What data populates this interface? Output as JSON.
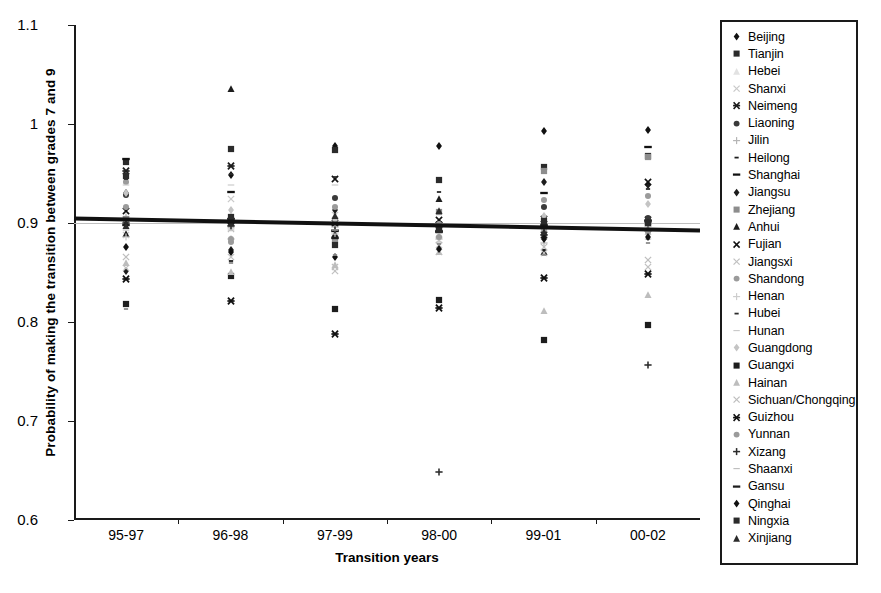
{
  "chart_data": {
    "type": "scatter",
    "title": "",
    "xlabel": "Transition years",
    "ylabel": "Probability of making the transition between grades 7 and 9",
    "categories": [
      "95-97",
      "96-98",
      "97-99",
      "98-00",
      "99-01",
      "00-02"
    ],
    "ylim": [
      0.6,
      1.1
    ],
    "yticks": [
      "0.6",
      "0.7",
      "0.8",
      "0.9",
      "1",
      "1.1"
    ],
    "ytick_values": [
      0.6,
      0.7,
      0.8,
      0.9,
      1.0,
      1.1
    ],
    "grid": "horizontal gridline at 0.9 only",
    "legend_position": "right, boxed",
    "trendline": {
      "name": "linear fit",
      "color": "#111111",
      "width_px": 4,
      "y_start": 0.9045,
      "y_end": 0.8925
    },
    "series": [
      {
        "name": "Beijing",
        "marker": "diamond-filled",
        "color": "#111111",
        "values": [
          0.93,
          0.948,
          0.978,
          0.978,
          0.993,
          0.994
        ]
      },
      {
        "name": "Tianjin",
        "marker": "square-filled",
        "color": "#2b2b2b",
        "values": [
          0.962,
          0.975,
          0.974,
          0.943,
          0.957,
          0.968
        ]
      },
      {
        "name": "Hebei",
        "marker": "triangle-light",
        "color": "#e2e2e2",
        "values": [
          0.902,
          0.908,
          0.899,
          0.901,
          0.9,
          0.899
        ]
      },
      {
        "name": "Shanxi",
        "marker": "x-light",
        "color": "#c9c9c9",
        "values": [
          0.888,
          0.924,
          0.908,
          0.883,
          0.889,
          0.891
        ]
      },
      {
        "name": "Neimeng",
        "marker": "star-x-bold",
        "color": "#1d1d1d",
        "values": [
          0.953,
          0.958,
          0.9,
          0.898,
          0.888,
          0.903
        ]
      },
      {
        "name": "Liaoning",
        "marker": "circle-filled",
        "color": "#3a3a3a",
        "values": [
          0.928,
          0.906,
          0.925,
          0.898,
          0.916,
          0.905
        ]
      },
      {
        "name": "Jilin",
        "marker": "plus-light",
        "color": "#b5b5b5",
        "values": [
          0.906,
          0.884,
          0.896,
          0.884,
          0.88,
          0.897
        ]
      },
      {
        "name": "Heilong",
        "marker": "dash-small",
        "color": "#1d1d1d",
        "values": [
          0.9,
          0.862,
          0.876,
          0.886,
          0.873,
          0.884
        ]
      },
      {
        "name": "Shanghai",
        "marker": "dash-bold",
        "color": "#111111",
        "values": [
          0.965,
          0.931,
          0.892,
          0.891,
          0.93,
          0.977
        ]
      },
      {
        "name": "Jiangsu",
        "marker": "diamond-filled",
        "color": "#1d1d1d",
        "values": [
          0.852,
          0.873,
          0.913,
          0.898,
          0.941,
          0.938
        ]
      },
      {
        "name": "Zhejiang",
        "marker": "square-grey",
        "color": "#8d8d8d",
        "values": [
          0.904,
          0.898,
          0.884,
          0.911,
          0.953,
          0.967
        ]
      },
      {
        "name": "Anhui",
        "marker": "triangle-dark",
        "color": "#1d1d1d",
        "values": [
          0.889,
          1.035,
          0.889,
          0.924,
          0.871,
          0.894
        ]
      },
      {
        "name": "Fujian",
        "marker": "x-bold",
        "color": "#111111",
        "values": [
          0.912,
          0.902,
          0.944,
          0.903,
          0.904,
          0.941
        ]
      },
      {
        "name": "Jiangsxi",
        "marker": "x-light",
        "color": "#c0c0c0",
        "values": [
          0.855,
          0.866,
          0.852,
          0.871,
          0.87,
          0.856
        ]
      },
      {
        "name": "Shandong",
        "marker": "circle-grey",
        "color": "#9b9b9b",
        "values": [
          0.941,
          0.881,
          0.916,
          0.899,
          0.923,
          0.927
        ]
      },
      {
        "name": "Henan",
        "marker": "plus-light",
        "color": "#cdcdcd",
        "values": [
          0.886,
          0.895,
          0.889,
          0.886,
          0.895,
          0.893
        ]
      },
      {
        "name": "Hubei",
        "marker": "dash-small",
        "color": "#2b2b2b",
        "values": [
          0.944,
          0.949,
          0.946,
          0.931,
          0.902,
          0.934
        ]
      },
      {
        "name": "Hunan",
        "marker": "dash-light",
        "color": "#c9c9c9",
        "values": [
          0.938,
          0.938,
          0.938,
          0.88,
          0.884,
          0.884
        ]
      },
      {
        "name": "Guangdong",
        "marker": "diamond-light",
        "color": "#c4c4c4",
        "values": [
          0.93,
          0.913,
          0.903,
          0.892,
          0.907,
          0.919
        ]
      },
      {
        "name": "Guangxi",
        "marker": "square-filled",
        "color": "#1d1d1d",
        "values": [
          0.818,
          0.846,
          0.813,
          0.822,
          0.782,
          0.797
        ]
      },
      {
        "name": "Hainan",
        "marker": "triangle-light",
        "color": "#bdbdbd",
        "values": [
          0.86,
          0.851,
          0.858,
          0.871,
          0.811,
          0.827
        ]
      },
      {
        "name": "Sichuan/Chongqing",
        "marker": "x-light",
        "color": "#bdbdbd",
        "values": [
          0.866,
          0.894,
          0.856,
          0.878,
          0.876,
          0.863
        ]
      },
      {
        "name": "Guizhou",
        "marker": "star-x-bold",
        "color": "#111111",
        "values": [
          0.843,
          0.821,
          0.788,
          0.814,
          0.844,
          0.848
        ]
      },
      {
        "name": "Yunnan",
        "marker": "circle-grey",
        "color": "#9b9b9b",
        "values": [
          0.916,
          0.884,
          0.881,
          0.886,
          0.893,
          0.891
        ]
      },
      {
        "name": "Xizang",
        "marker": "plus-bold",
        "color": "#2b2b2b",
        "values": [
          0.9,
          0.897,
          0.893,
          0.648,
          0.897,
          0.757
        ]
      },
      {
        "name": "Shaanxi",
        "marker": "dash-light",
        "color": "#bdbdbd",
        "values": [
          0.893,
          0.893,
          0.893,
          0.893,
          0.893,
          0.893
        ]
      },
      {
        "name": "Gansu",
        "marker": "dash-bold",
        "color": "#1d1d1d",
        "values": [
          0.898,
          0.904,
          0.885,
          0.892,
          0.898,
          0.902
        ]
      },
      {
        "name": "Qinghai",
        "marker": "diamond-filled",
        "color": "#111111",
        "values": [
          0.876,
          0.871,
          0.866,
          0.874,
          0.884,
          0.886
        ]
      },
      {
        "name": "Ningxia",
        "marker": "square-filled",
        "color": "#2b2b2b",
        "values": [
          0.947,
          0.906,
          0.878,
          0.893,
          0.902,
          0.9
        ]
      },
      {
        "name": "Xinjiang",
        "marker": "triangle-dark",
        "color": "#2b2b2b",
        "values": [
          0.897,
          0.9,
          0.907,
          0.912,
          0.891,
          0.901
        ]
      },
      {
        "name": "__extra_low",
        "marker": "dash-small",
        "color": "#8d8d8d",
        "values": [
          0.813,
          0.86,
          0.868,
          0.879,
          0.868,
          0.88
        ]
      }
    ]
  },
  "legend": {
    "items": [
      {
        "label": "Beijing"
      },
      {
        "label": "Tianjin"
      },
      {
        "label": "Hebei"
      },
      {
        "label": "Shanxi"
      },
      {
        "label": "Neimeng"
      },
      {
        "label": "Liaoning"
      },
      {
        "label": "Jilin"
      },
      {
        "label": "Heilong"
      },
      {
        "label": "Shanghai"
      },
      {
        "label": "Jiangsu"
      },
      {
        "label": "Zhejiang"
      },
      {
        "label": "Anhui"
      },
      {
        "label": "Fujian"
      },
      {
        "label": "Jiangsxi"
      },
      {
        "label": "Shandong"
      },
      {
        "label": "Henan"
      },
      {
        "label": "Hubei"
      },
      {
        "label": "Hunan"
      },
      {
        "label": "Guangdong"
      },
      {
        "label": "Guangxi"
      },
      {
        "label": "Hainan"
      },
      {
        "label": "Sichuan/Chongqing"
      },
      {
        "label": "Guizhou"
      },
      {
        "label": "Yunnan"
      },
      {
        "label": "Xizang"
      },
      {
        "label": "Shaanxi"
      },
      {
        "label": "Gansu"
      },
      {
        "label": "Qinghai"
      },
      {
        "label": "Ningxia"
      },
      {
        "label": "Xinjiang"
      }
    ]
  },
  "colors": {
    "axis": "#1a1a1a",
    "gridline": "#bfbfbf",
    "trendline": "#111111",
    "background": "#ffffff"
  }
}
